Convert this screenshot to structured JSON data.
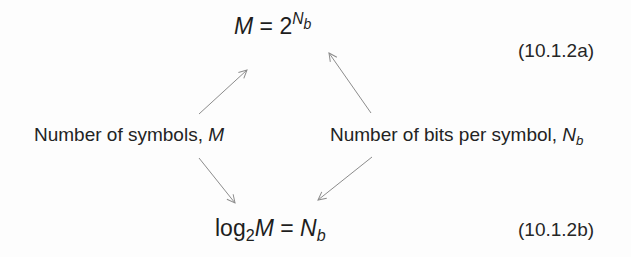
{
  "equations": {
    "a": {
      "lhs": "M",
      "equals": "=",
      "base": "2",
      "exp_var": "N",
      "exp_sub": "b",
      "number": "(10.1.2a)"
    },
    "b": {
      "log": "log",
      "log_base": "2",
      "arg": "M",
      "equals": "=",
      "rhs_var": "N",
      "rhs_sub": "b",
      "number": "(10.1.2b)"
    }
  },
  "labels": {
    "left": {
      "text": "Number of symbols, ",
      "var": "M"
    },
    "right": {
      "text": "Number of bits per symbol, ",
      "var": "N",
      "var_sub": "b"
    }
  },
  "colors": {
    "text": "#1e1e1e",
    "arrow": "#8c8c8c",
    "background": "#fdfdfd"
  },
  "arrows": [
    {
      "name": "symbols-to-eq-a",
      "from": [
        199,
        114
      ],
      "to": [
        247,
        70
      ]
    },
    {
      "name": "bits-to-eq-a",
      "from": [
        371,
        113
      ],
      "to": [
        329,
        53
      ]
    },
    {
      "name": "symbols-to-eq-b",
      "from": [
        199,
        158
      ],
      "to": [
        235,
        203
      ]
    },
    {
      "name": "bits-to-eq-b",
      "from": [
        372,
        157
      ],
      "to": [
        318,
        200
      ]
    }
  ]
}
